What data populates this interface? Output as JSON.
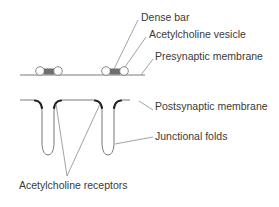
{
  "diagram": {
    "labels": {
      "dense_bar": "Dense bar",
      "ach_vesicle": "Acetylcholine vesicle",
      "presynaptic": "Presynaptic membrane",
      "postsynaptic": "Postsynaptic membrane",
      "junctional_folds": "Junctional folds",
      "ach_receptors": "Acetylcholine receptors"
    },
    "colors": {
      "line": "#7a7a7a",
      "leader": "#8a8a8a",
      "dense_bar_fill": "#6e6e6e",
      "receptor_fill": "#222222",
      "text": "#3a3a3a"
    }
  }
}
